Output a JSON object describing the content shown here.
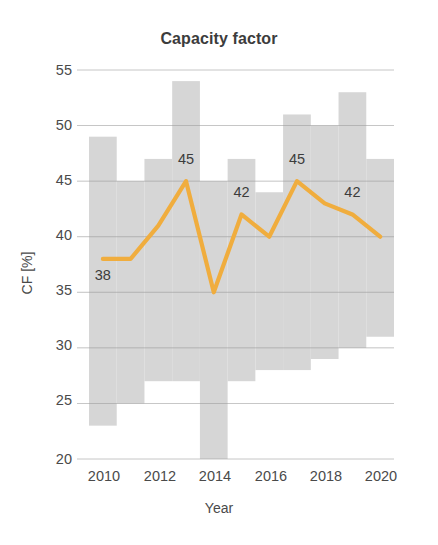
{
  "chart_data": {
    "type": "line",
    "title": "Capacity factor",
    "xlabel": "Year",
    "ylabel": "CF [%]",
    "xlim": [
      2009.5,
      2020.5
    ],
    "ylim": [
      20,
      55
    ],
    "yticks": [
      20,
      25,
      30,
      35,
      40,
      45,
      50,
      55
    ],
    "xticks": [
      2010,
      2012,
      2014,
      2016,
      2018,
      2020
    ],
    "xtick_labels": [
      "2010",
      "2012",
      "2014",
      "2016",
      "2018",
      "2020"
    ],
    "ytick_labels": [
      "20",
      "25",
      "30",
      "35",
      "40",
      "45",
      "50",
      "55"
    ],
    "grid": true,
    "legend": "none",
    "x": [
      2010,
      2011,
      2012,
      2013,
      2014,
      2015,
      2016,
      2017,
      2018,
      2019,
      2020
    ],
    "series": [
      {
        "name": "Capacity factor",
        "type": "line",
        "color": "#f0ad3e",
        "values": [
          38,
          38,
          41,
          45,
          35,
          42,
          40,
          45,
          43,
          42,
          40
        ]
      },
      {
        "name": "Range band",
        "type": "band",
        "color": "#d6d6d6",
        "low": [
          23,
          25,
          27,
          27,
          20,
          27,
          28,
          28,
          29,
          30,
          31
        ],
        "high": [
          49,
          45,
          47,
          54,
          45,
          47,
          44,
          51,
          50,
          53,
          47
        ]
      }
    ],
    "annotations": [
      {
        "x": 2010,
        "y": 38,
        "text": "38",
        "position": "below"
      },
      {
        "x": 2013,
        "y": 45,
        "text": "45",
        "position": "above"
      },
      {
        "x": 2015,
        "y": 42,
        "text": "42",
        "position": "above"
      },
      {
        "x": 2017,
        "y": 45,
        "text": "45",
        "position": "above"
      },
      {
        "x": 2019,
        "y": 42,
        "text": "42",
        "position": "above"
      }
    ]
  },
  "colors": {
    "line": "#f0ad3e",
    "band": "#d6d6d6",
    "grid": "#9a9a9a",
    "text": "#4a4a4a",
    "background": "#ffffff"
  }
}
